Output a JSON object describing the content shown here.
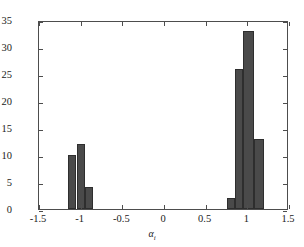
{
  "chart_data": {
    "type": "bar",
    "title": "",
    "subtitle": "",
    "xlabel": "α",
    "xlabel_subscript": "i",
    "ylabel": "",
    "xlim": [
      -1.5,
      1.5
    ],
    "ylim": [
      0,
      35
    ],
    "grid": false,
    "legend": null,
    "xticks": [
      -1.5,
      -1,
      -0.5,
      0,
      0.5,
      1,
      1.5
    ],
    "xtick_labels": [
      "-1.5",
      "-1",
      "-0.5",
      "0",
      "0.5",
      "1",
      "1.5"
    ],
    "yticks": [
      0,
      5,
      10,
      15,
      20,
      25,
      30,
      35
    ],
    "ytick_labels": [
      "0",
      "5",
      "10",
      "15",
      "20",
      "25",
      "30",
      "35"
    ],
    "bar_color": "#4a4a4a",
    "bar_edge_color": "#2e2e2e",
    "axis_color": "#4d4d4d",
    "background_color": "#ffffff",
    "bins": [
      {
        "left": -1.15,
        "right": -1.05,
        "value": 10
      },
      {
        "left": -1.05,
        "right": -0.95,
        "value": 12
      },
      {
        "left": -0.95,
        "right": -0.85,
        "value": 4
      },
      {
        "left": 0.75,
        "right": 0.85,
        "value": 2
      },
      {
        "left": 0.85,
        "right": 0.95,
        "value": 26
      },
      {
        "left": 0.95,
        "right": 1.08,
        "value": 33
      },
      {
        "left": 1.08,
        "right": 1.2,
        "value": 13
      }
    ],
    "categories": [
      "-1.10",
      "-1.00",
      "-0.90",
      "0.80",
      "0.90",
      "1.01",
      "1.14"
    ],
    "values": [
      10,
      12,
      4,
      2,
      26,
      33,
      13
    ]
  }
}
